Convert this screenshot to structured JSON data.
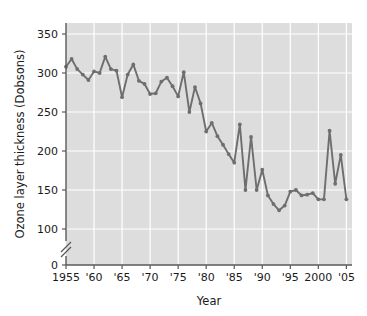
{
  "chart_data": {
    "type": "line",
    "title": "",
    "xlabel": "Year",
    "ylabel": "Ozone layer thickness (Dobsons)",
    "xlim": [
      1955,
      2006
    ],
    "ylim": [
      0,
      360
    ],
    "y_axis_break": true,
    "y_axis_break_between": [
      0,
      100
    ],
    "grid": true,
    "legend": "none",
    "xticks": [
      1955,
      1960,
      1965,
      1970,
      1975,
      1980,
      1985,
      1990,
      1995,
      2000,
      2005
    ],
    "xtick_labels": [
      "1955",
      "'60",
      "'65",
      "'70",
      "'75",
      "'80",
      "'85",
      "'90",
      "'95",
      "2000",
      "'05"
    ],
    "yticks": [
      0,
      100,
      150,
      200,
      250,
      300,
      350
    ],
    "ytick_labels": [
      "0",
      "100",
      "150",
      "200",
      "250",
      "300",
      "350"
    ],
    "series": [
      {
        "name": "Ozone layer thickness",
        "color": "#6e6e6e",
        "marker": "circle",
        "x": [
          1955,
          1956,
          1957,
          1958,
          1959,
          1960,
          1961,
          1962,
          1963,
          1964,
          1965,
          1966,
          1967,
          1968,
          1969,
          1970,
          1971,
          1972,
          1973,
          1974,
          1975,
          1976,
          1977,
          1978,
          1979,
          1980,
          1981,
          1982,
          1983,
          1984,
          1985,
          1986,
          1987,
          1988,
          1989,
          1990,
          1991,
          1992,
          1993,
          1994,
          1995,
          1996,
          1997,
          1998,
          1999,
          2000,
          2001,
          2002,
          2003,
          2004,
          2005
        ],
        "values": [
          308,
          318,
          305,
          298,
          291,
          302,
          300,
          321,
          305,
          303,
          269,
          298,
          311,
          290,
          286,
          273,
          274,
          289,
          294,
          283,
          270,
          301,
          250,
          282,
          261,
          225,
          236,
          219,
          208,
          196,
          185,
          234,
          150,
          218,
          150,
          176,
          143,
          132,
          124,
          130,
          148,
          150,
          143,
          144,
          146,
          138,
          138,
          226,
          158,
          195,
          138
        ]
      }
    ]
  },
  "axes": {
    "x_title": "Year",
    "y_title": "Ozone layer thickness (Dobsons)"
  }
}
